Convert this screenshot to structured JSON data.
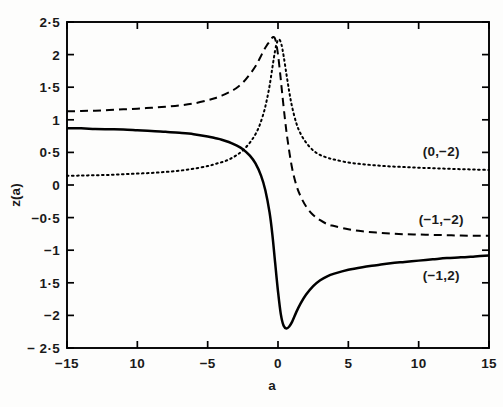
{
  "chart_data": {
    "type": "line",
    "title": "",
    "subtitle": "",
    "xlabel": "a",
    "ylabel": "z(a)",
    "xlim": [
      -15,
      15
    ],
    "ylim": [
      -2.5,
      2.5
    ],
    "grid": false,
    "legend_position": "inline-right-of-curves",
    "x_ticks": [
      -15,
      -10,
      -5,
      0,
      5,
      10,
      15
    ],
    "x_tick_labels": [
      "−15",
      "10",
      "−5",
      "0",
      "5",
      "10",
      "15"
    ],
    "y_ticks": [
      2.5,
      2,
      1.5,
      1,
      0.5,
      0,
      -0.5,
      -1,
      -1.5,
      -2,
      -2.5
    ],
    "y_tick_labels": [
      "2·5",
      "2",
      "1·5",
      "1",
      "0·5",
      "0",
      "−0·5",
      "−1",
      "1·5",
      "−2",
      "− 2·5"
    ],
    "series": [
      {
        "name": "(−1,2)",
        "label": "(−1,2)",
        "style": "solid",
        "color": "#000000",
        "annotation_x": 11.6,
        "annotation_y": -1.38,
        "x": [
          -15,
          -14,
          -13,
          -12,
          -11,
          -10,
          -9,
          -8,
          -7,
          -6,
          -5,
          -4.5,
          -4,
          -3.5,
          -3,
          -2.5,
          -2,
          -1.6,
          -1.2,
          -0.9,
          -0.6,
          -0.4,
          -0.2,
          0,
          0.2,
          0.4,
          0.6,
          0.8,
          1,
          1.3,
          1.6,
          2,
          2.5,
          3,
          3.5,
          4,
          5,
          6,
          7,
          8,
          9,
          10,
          11,
          12,
          13,
          14,
          15
        ],
        "y": [
          0.87,
          0.87,
          0.86,
          0.855,
          0.85,
          0.84,
          0.83,
          0.815,
          0.8,
          0.78,
          0.745,
          0.72,
          0.695,
          0.66,
          0.61,
          0.55,
          0.45,
          0.33,
          0.14,
          -0.08,
          -0.42,
          -0.76,
          -1.2,
          -1.63,
          -1.98,
          -2.16,
          -2.2,
          -2.17,
          -2.1,
          -1.95,
          -1.82,
          -1.68,
          -1.55,
          -1.46,
          -1.4,
          -1.36,
          -1.3,
          -1.26,
          -1.23,
          -1.2,
          -1.18,
          -1.16,
          -1.14,
          -1.12,
          -1.11,
          -1.095,
          -1.08
        ]
      },
      {
        "name": "(−1,−2)",
        "label": "(−1,−2)",
        "style": "dashed",
        "color": "#000000",
        "annotation_x": 11.6,
        "annotation_y": -0.52,
        "x": [
          -15,
          -14,
          -13,
          -12,
          -11,
          -10,
          -9,
          -8,
          -7,
          -6,
          -5,
          -4.5,
          -4,
          -3.5,
          -3,
          -2.5,
          -2,
          -1.6,
          -1.3,
          -1,
          -0.8,
          -0.6,
          -0.45,
          -0.35,
          -0.25,
          -0.15,
          0,
          0.15,
          0.3,
          0.5,
          0.7,
          1,
          1.3,
          1.6,
          2,
          2.5,
          3,
          3.5,
          4,
          5,
          6,
          7,
          8,
          9,
          10,
          11,
          12,
          13,
          14,
          15
        ],
        "y": [
          1.13,
          1.135,
          1.14,
          1.15,
          1.16,
          1.17,
          1.185,
          1.2,
          1.22,
          1.25,
          1.3,
          1.33,
          1.37,
          1.42,
          1.48,
          1.57,
          1.7,
          1.82,
          1.94,
          2.07,
          2.14,
          2.2,
          2.25,
          2.27,
          2.26,
          2.2,
          2.0,
          1.72,
          1.4,
          1.0,
          0.66,
          0.26,
          0.0,
          -0.17,
          -0.33,
          -0.46,
          -0.54,
          -0.6,
          -0.63,
          -0.68,
          -0.71,
          -0.73,
          -0.745,
          -0.755,
          -0.76,
          -0.765,
          -0.77,
          -0.775,
          -0.778,
          -0.78
        ]
      },
      {
        "name": "(0,−2)",
        "label": "(0,−2)",
        "style": "dotted",
        "color": "#000000",
        "annotation_x": 11.6,
        "annotation_y": 0.52,
        "x": [
          -15,
          -14,
          -13,
          -12,
          -11,
          -10,
          -9,
          -8,
          -7,
          -6,
          -5,
          -4.5,
          -4,
          -3.5,
          -3,
          -2.5,
          -2,
          -1.6,
          -1.3,
          -1,
          -0.8,
          -0.6,
          -0.4,
          -0.2,
          -0.05,
          0.1,
          0.25,
          0.4,
          0.6,
          0.8,
          1,
          1.3,
          1.6,
          2,
          2.5,
          3,
          3.5,
          4,
          5,
          6,
          7,
          8,
          9,
          10,
          11,
          12,
          13,
          14,
          15
        ],
        "y": [
          0.14,
          0.145,
          0.15,
          0.155,
          0.165,
          0.175,
          0.185,
          0.2,
          0.22,
          0.25,
          0.29,
          0.32,
          0.35,
          0.39,
          0.45,
          0.53,
          0.65,
          0.78,
          0.92,
          1.12,
          1.3,
          1.52,
          1.8,
          2.07,
          2.2,
          2.23,
          2.15,
          1.98,
          1.7,
          1.43,
          1.2,
          0.95,
          0.79,
          0.65,
          0.53,
          0.46,
          0.42,
          0.39,
          0.345,
          0.32,
          0.3,
          0.285,
          0.275,
          0.265,
          0.258,
          0.25,
          0.243,
          0.237,
          0.23
        ]
      }
    ]
  },
  "figure": {
    "background_color": "#fdfdfc",
    "axis_color": "#000000"
  }
}
